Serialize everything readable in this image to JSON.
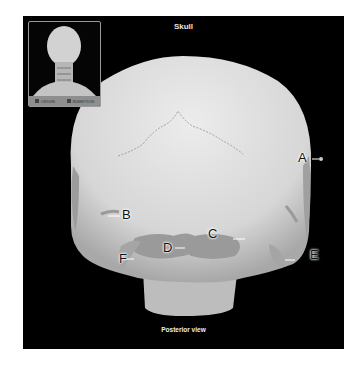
{
  "figure": {
    "title": "Skull",
    "caption": "Posterior view",
    "background_color": "#000000",
    "bone_color": "#d9d9d9"
  },
  "inset": {
    "description": "posterior head and neck thumbnail",
    "legend": [
      {
        "label": "ORIGIN",
        "color": "#444444"
      },
      {
        "label": "INSERTION",
        "color": "#444444"
      }
    ]
  },
  "labels": [
    {
      "id": "A",
      "text": "A"
    },
    {
      "id": "B",
      "text": "B"
    },
    {
      "id": "C",
      "text": "C"
    },
    {
      "id": "D",
      "text": "D"
    },
    {
      "id": "E",
      "text": "E"
    },
    {
      "id": "F",
      "text": "F"
    }
  ]
}
